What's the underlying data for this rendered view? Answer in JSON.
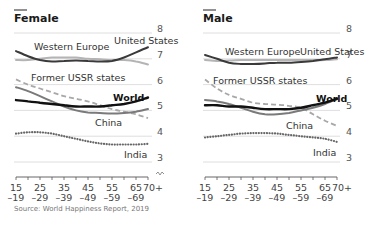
{
  "source": "Source: World Happiness Report, 2019",
  "chart_data": [
    {
      "type": "line",
      "title": "Female",
      "xlabel": "Age group",
      "ylabel": "Life satisfaction",
      "ylim": [
        3,
        8
      ],
      "yticks": [
        3,
        4,
        5,
        6,
        7,
        8
      ],
      "grid": true,
      "x": [
        "15-19",
        "20-24",
        "25-29",
        "30-34",
        "35-39",
        "40-44",
        "45-49",
        "50-54",
        "55-59",
        "60-64",
        "65-69",
        "70+"
      ],
      "xtick_labels": [
        {
          "top": "15",
          "bottom": "–19",
          "index": 0
        },
        {
          "top": "25",
          "bottom": "–29",
          "index": 2
        },
        {
          "top": "35",
          "bottom": "–39",
          "index": 4
        },
        {
          "top": "45",
          "bottom": "–49",
          "index": 6
        },
        {
          "top": "55",
          "bottom": "–59",
          "index": 8
        },
        {
          "top": "65",
          "bottom": "–69",
          "index": 10
        },
        {
          "top": "70+",
          "bottom": "",
          "index": 11
        }
      ],
      "series": [
        {
          "name": "United States",
          "style": "solid",
          "color": "#3a3a3a",
          "width": 2,
          "values": [
            7.3,
            7.1,
            6.95,
            6.9,
            6.92,
            6.93,
            6.92,
            6.9,
            6.92,
            7.05,
            7.25,
            7.45
          ],
          "label_pos": [
            114,
            44
          ]
        },
        {
          "name": "Western Europe",
          "style": "solid",
          "color": "#b4b4b4",
          "width": 2,
          "values": [
            6.95,
            6.95,
            7.0,
            7.05,
            7.05,
            7.05,
            7.0,
            6.98,
            6.95,
            6.95,
            6.9,
            6.78
          ],
          "label_pos": [
            34,
            50
          ]
        },
        {
          "name": "Former USSR states",
          "style": "dashed",
          "color": "#a8a8a8",
          "width": 1.8,
          "values": [
            6.2,
            6.0,
            5.85,
            5.7,
            5.55,
            5.45,
            5.35,
            5.2,
            5.05,
            4.95,
            4.85,
            4.7
          ],
          "label_pos": [
            31,
            81
          ]
        },
        {
          "name": "China",
          "style": "solid",
          "color": "#7a7a7a",
          "width": 2,
          "values": [
            5.9,
            5.75,
            5.55,
            5.35,
            5.15,
            5.0,
            4.92,
            4.9,
            4.88,
            4.9,
            4.95,
            5.05
          ],
          "label_pos": [
            95,
            126
          ]
        },
        {
          "name": "World",
          "style": "solid",
          "color": "#111111",
          "width": 2.4,
          "bold_label": true,
          "values": [
            5.4,
            5.35,
            5.3,
            5.25,
            5.2,
            5.15,
            5.15,
            5.15,
            5.2,
            5.25,
            5.35,
            5.5
          ],
          "label_pos": [
            113,
            101
          ]
        },
        {
          "name": "India",
          "style": "dotted",
          "color": "#666666",
          "width": 2,
          "values": [
            4.1,
            4.15,
            4.15,
            4.1,
            4.0,
            3.9,
            3.8,
            3.72,
            3.68,
            3.68,
            3.68,
            3.7
          ],
          "label_pos": [
            124,
            158
          ]
        }
      ]
    },
    {
      "type": "line",
      "title": "Male",
      "xlabel": "Age group",
      "ylabel": "Life satisfaction",
      "ylim": [
        3,
        8
      ],
      "yticks": [
        3,
        4,
        5,
        6,
        7,
        8
      ],
      "grid": true,
      "x": [
        "15-19",
        "20-24",
        "25-29",
        "30-34",
        "35-39",
        "40-44",
        "45-49",
        "50-54",
        "55-59",
        "60-64",
        "65-69",
        "70+"
      ],
      "xtick_labels": [
        {
          "top": "15",
          "bottom": "–19",
          "index": 0
        },
        {
          "top": "25",
          "bottom": "–29",
          "index": 2
        },
        {
          "top": "35",
          "bottom": "–39",
          "index": 4
        },
        {
          "top": "45",
          "bottom": "–49",
          "index": 6
        },
        {
          "top": "55",
          "bottom": "–59",
          "index": 8
        },
        {
          "top": "65",
          "bottom": "–69",
          "index": 10
        },
        {
          "top": "70+",
          "bottom": "",
          "index": 11
        }
      ],
      "series": [
        {
          "name": "United States",
          "style": "solid",
          "color": "#3a3a3a",
          "width": 2,
          "values": [
            7.15,
            7.0,
            6.85,
            6.8,
            6.8,
            6.82,
            6.85,
            6.85,
            6.88,
            6.92,
            6.98,
            7.05
          ],
          "label_pos": [
            300,
            55
          ]
        },
        {
          "name": "Western Europe",
          "style": "solid",
          "color": "#b4b4b4",
          "width": 2,
          "values": [
            6.95,
            6.92,
            6.93,
            6.95,
            6.95,
            6.95,
            6.95,
            6.95,
            6.95,
            6.95,
            6.95,
            6.98
          ],
          "label_pos": [
            225,
            55
          ]
        },
        {
          "name": "Former USSR states",
          "style": "dashed",
          "color": "#a8a8a8",
          "width": 1.8,
          "values": [
            6.2,
            5.85,
            5.6,
            5.45,
            5.3,
            5.25,
            5.22,
            5.18,
            5.1,
            4.85,
            4.6,
            4.4
          ],
          "label_pos": [
            213,
            84
          ]
        },
        {
          "name": "China",
          "style": "solid",
          "color": "#7a7a7a",
          "width": 2,
          "values": [
            5.4,
            5.35,
            5.25,
            5.1,
            4.95,
            4.85,
            4.85,
            4.9,
            5.0,
            5.1,
            5.25,
            5.45
          ],
          "label_pos": [
            286,
            129
          ]
        },
        {
          "name": "World",
          "style": "solid",
          "color": "#111111",
          "width": 2.4,
          "bold_label": true,
          "values": [
            5.2,
            5.2,
            5.15,
            5.15,
            5.1,
            5.05,
            5.05,
            5.05,
            5.1,
            5.2,
            5.3,
            5.45
          ],
          "label_pos": [
            316,
            102
          ]
        },
        {
          "name": "India",
          "style": "dotted",
          "color": "#666666",
          "width": 2,
          "values": [
            3.95,
            4.0,
            4.05,
            4.1,
            4.12,
            4.12,
            4.1,
            4.05,
            4.0,
            3.95,
            3.9,
            3.78
          ],
          "label_pos": [
            313,
            156
          ]
        }
      ]
    }
  ]
}
